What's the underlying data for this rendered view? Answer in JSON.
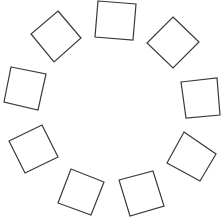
{
  "diagram": {
    "background": "#ffffff",
    "stroke_color": "#3a3a3a",
    "shapes": [
      {
        "name": "square-top",
        "points": "98,1 136,4 133,40 95,37"
      },
      {
        "name": "square-upper-right",
        "points": "173,17 199,42 173,68 147,43"
      },
      {
        "name": "square-right",
        "points": "181,82 217,78 220,115 186,118"
      },
      {
        "name": "square-lower-right",
        "points": "184,132 216,154 200,181 167,163"
      },
      {
        "name": "square-bottom-right",
        "points": "119,180 153,171 164,206 130,216"
      },
      {
        "name": "square-bottom-left",
        "points": "71,169 104,182 91,215 58,203"
      },
      {
        "name": "square-lower-left",
        "points": "9,141 42,125 58,157 25,173"
      },
      {
        "name": "square-left",
        "points": "11,67 46,74 38,110 4,102"
      },
      {
        "name": "square-upper-left",
        "points": "58,11 81,38 54,62 31,34"
      }
    ]
  }
}
